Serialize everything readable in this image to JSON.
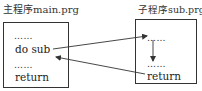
{
  "main_program": {
    "title": "主程序main.prg",
    "lines": [
      {
        "type": "ellipsis",
        "text": "……"
      },
      {
        "type": "code",
        "text": "do sub"
      },
      {
        "type": "ellipsis",
        "text": "……"
      },
      {
        "type": "code",
        "text": "return"
      }
    ]
  },
  "sub_program": {
    "title": "子程序sub.prg",
    "lines": [
      {
        "type": "ellipsis",
        "text": "……"
      },
      {
        "type": "ellipsis",
        "text": "……"
      },
      {
        "type": "code",
        "text": "return"
      }
    ]
  },
  "arrows": [
    {
      "from": "main.do sub",
      "to": "sub.first line",
      "label": "call"
    },
    {
      "from": "sub.first ellipsis",
      "to": "sub.second ellipsis",
      "label": "sequential flow"
    },
    {
      "from": "sub.return",
      "to": "main.after do sub",
      "label": "return"
    }
  ],
  "colors": {
    "line": "#333333",
    "background": "#ffffff"
  }
}
